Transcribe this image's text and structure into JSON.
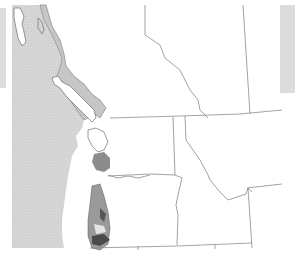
{
  "map": {
    "region": "Pacific Northwest",
    "colors": {
      "background": "#ffffff",
      "ocean": "#d6d6d6",
      "coastal_band": "#c4c4c4",
      "dark_shading": "#6a6a6a",
      "mid_shading": "#9a9a9a",
      "border": "#8a8a8a",
      "side_panel": "#dedede"
    },
    "features": [
      {
        "name": "ocean",
        "fill": "stippled light gray"
      },
      {
        "name": "coastal-band",
        "fill": "gray"
      },
      {
        "name": "shaded-coastal-range",
        "fill": "dark gray"
      },
      {
        "name": "state-province-borders",
        "fill": "none"
      }
    ]
  }
}
